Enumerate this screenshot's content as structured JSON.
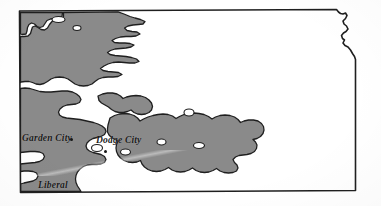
{
  "figure": {
    "kind": "thematic-choropleth-map",
    "region": "Kansas",
    "background_color": "#ffffff",
    "outline_color": "#1f1f1f",
    "shaded_fill_color": "#8a8a8a",
    "unshaded_fill_color": "#ffffff"
  },
  "labels": {
    "garden_city": "Garden City",
    "dodge_city": "Dodge City",
    "liberal": "Liberal"
  },
  "markers": {
    "garden_city_dot": "city-point-marker",
    "dodge_city_dot": "city-point-marker"
  },
  "icons": {
    "state-outline": "state-boundary-outline",
    "shaded-area": "shaded-region-fill",
    "city-point-marker": "filled-circle-dot"
  },
  "geometry": {
    "state_outline_path": "M 19.5 11.0 L 336.5 9.5 L 338.5 12.0 L 340.5 13.5 L 343.0 14.0 L 345.5 13.0 L 347.0 15.5 L 345.5 18.5 L 343.0 21.0 L 344.0 24.0 L 346.5 26.0 L 348.0 29.0 L 346.0 31.5 L 343.5 33.0 L 341.5 35.5 L 342.5 38.5 L 344.5 40.0 L 343.0 43.0 L 345.0 45.5 L 348.0 47.0 L 350.5 50.0 L 352.5 53.5 L 354.5 56.5 L 355.5 59.5 L 355.5 190.5 L 20.5 192.5 Z",
    "shaded_region_paths": [
      "M 20.5 12.5 L 62.5 12.5 L 62.0 16.5 L 58.0 17.0 L 54.5 18.5 L 50.5 19.0 L 47.0 20.5 L 45.0 23.5 L 43.0 26.5 L 40.0 27.5 L 37.0 26.5 L 34.5 24.0 L 31.5 23.0 L 29.0 24.5 L 27.5 27.5 L 27.0 31.0 L 26.0 34.0 L 22.0 34.5 L 20.5 34.0 Z",
      "M 63.5 12.5 L 118.0 11.8 L 124.0 14.0 L 130.0 16.5 L 135.0 18.0 L 140.5 19.5 L 145.0 21.5 L 143.0 24.0 L 138.5 24.5 L 133.0 25.0 L 128.0 26.0 L 124.5 28.0 L 127.0 30.5 L 132.0 31.5 L 137.0 32.0 L 140.0 34.0 L 136.0 36.0 L 131.0 36.5 L 126.0 36.5 L 120.5 37.0 L 115.5 38.5 L 112.0 40.5 L 114.5 42.5 L 119.5 43.0 L 125.0 43.0 L 130.0 43.5 L 134.0 45.0 L 131.0 47.0 L 126.0 48.0 L 120.5 48.5 L 115.0 49.0 L 110.5 50.5 L 107.5 52.5 L 110.0 54.5 L 115.0 55.5 L 120.5 56.0 L 126.0 56.5 L 131.5 57.5 L 136.5 59.0 L 139.0 61.5 L 135.0 63.0 L 129.5 63.0 L 124.0 62.5 L 118.5 62.0 L 113.0 62.5 L 108.0 64.0 L 104.0 66.0 L 100.5 68.5 L 103.0 70.5 L 108.0 71.5 L 113.5 72.0 L 118.5 72.5 L 122.0 74.5 L 118.0 76.5 L 113.0 77.0 L 108.0 77.0 L 103.0 77.5 L 98.5 79.0 L 95.0 81.5 L 92.0 84.0 L 88.0 85.5 L 83.5 86.0 L 79.0 85.5 L 75.0 84.0 L 71.5 81.5 L 68.0 79.0 L 64.0 77.5 L 59.5 77.0 L 55.0 77.5 L 51.0 79.0 L 47.5 81.5 L 44.0 83.5 L 40.0 84.5 L 36.0 84.0 L 32.5 82.5 L 29.0 81.5 L 25.0 81.5 L 21.0 82.0 L 20.5 82.5 L 20.5 36.5 L 24.0 36.5 L 28.0 36.0 L 30.5 33.5 L 31.5 30.0 L 32.5 27.0 L 35.0 26.0 L 38.0 27.5 L 41.0 29.5 L 44.5 30.0 L 47.5 28.0 L 49.5 24.5 L 52.0 21.5 L 56.0 20.0 L 60.5 19.0 L 63.5 17.0 Z",
      "M 20.5 88.5 L 25.0 88.0 L 30.0 88.5 L 35.0 90.0 L 40.0 91.5 L 45.5 92.0 L 51.0 92.0 L 56.5 91.5 L 62.0 91.0 L 67.5 91.0 L 72.5 92.0 L 76.5 94.0 L 79.5 96.5 L 81.0 99.5 L 79.5 102.5 L 76.0 104.0 L 71.5 104.5 L 67.0 105.0 L 63.0 106.5 L 60.0 109.0 L 58.5 112.0 L 59.5 115.0 L 62.5 117.0 L 66.5 118.0 L 71.0 118.5 L 75.5 119.0 L 80.0 119.5 L 84.5 120.5 L 89.0 121.5 L 93.5 122.5 L 98.0 124.0 L 102.0 126.0 L 105.0 128.5 L 106.0 131.5 L 104.5 134.5 L 101.0 136.5 L 97.0 137.5 L 93.0 138.5 L 89.5 140.5 L 87.0 143.0 L 86.0 146.0 L 87.0 149.0 L 89.5 151.0 L 93.0 152.5 L 97.0 153.5 L 101.0 154.5 L 104.5 156.5 L 106.0 159.5 L 104.5 162.5 L 101.0 164.0 L 96.5 164.5 L 92.0 164.5 L 87.5 165.0 L 83.5 166.5 L 80.0 169.0 L 77.5 172.0 L 76.0 175.5 L 75.5 179.0 L 76.0 182.5 L 77.5 186.0 L 79.5 189.0 L 81.0 191.5 L 20.5 191.5 L 20.5 184.0 L 24.0 183.0 L 28.5 182.0 L 33.0 181.0 L 36.5 179.0 L 38.0 176.0 L 36.5 173.0 L 33.0 171.5 L 28.5 171.0 L 24.0 171.0 L 20.5 171.5 L 20.5 164.0 L 25.0 163.5 L 30.0 163.0 L 35.0 162.5 L 39.5 161.5 L 43.0 159.5 L 44.5 156.5 L 43.0 153.5 L 39.5 152.0 L 35.0 151.5 L 30.0 151.5 L 25.0 152.0 L 20.5 152.5 Z",
      "M 110.0 118.0 L 114.5 115.5 L 119.5 114.0 L 124.5 113.5 L 129.5 114.0 L 134.0 115.5 L 137.5 118.0 L 140.0 121.0 L 143.5 119.0 L 148.0 117.0 L 153.0 115.5 L 158.0 114.5 L 163.0 114.0 L 168.0 114.5 L 172.5 116.0 L 176.0 118.5 L 179.5 116.5 L 184.0 114.5 L 189.0 113.5 L 194.0 113.0 L 199.0 113.5 L 204.0 114.5 L 208.5 116.5 L 212.0 119.0 L 215.5 117.0 L 220.0 115.5 L 225.0 115.0 L 230.0 115.5 L 234.5 117.0 L 238.0 119.5 L 240.5 122.5 L 244.0 121.0 L 248.5 120.0 L 253.5 120.0 L 258.0 121.0 L 261.5 123.5 L 263.5 126.5 L 264.0 130.0 L 263.0 133.5 L 260.5 136.5 L 257.0 138.5 L 253.0 139.5 L 255.5 142.0 L 257.0 145.0 L 256.5 148.5 L 254.5 151.5 L 251.0 153.5 L 247.0 154.5 L 243.0 155.0 L 239.0 155.5 L 235.5 157.0 L 233.0 159.5 L 234.5 162.5 L 237.0 165.0 L 238.0 168.0 L 236.5 171.0 L 233.0 172.5 L 228.5 173.0 L 224.0 172.5 L 220.0 171.0 L 216.5 168.5 L 213.0 170.5 L 209.0 172.0 L 204.5 172.5 L 200.0 172.0 L 196.0 170.5 L 192.5 168.0 L 189.0 170.0 L 185.0 171.5 L 180.5 172.0 L 176.0 171.5 L 172.0 170.0 L 168.5 167.5 L 165.0 169.5 L 161.0 171.0 L 156.5 171.5 L 152.0 171.0 L 148.0 169.5 L 144.5 167.0 L 142.0 164.0 L 140.5 160.5 L 137.0 162.0 L 132.5 162.5 L 128.0 162.0 L 124.0 160.5 L 120.5 158.0 L 118.0 155.0 L 116.5 151.5 L 116.0 148.0 L 116.5 144.5 L 118.0 141.0 L 115.0 139.5 L 111.5 137.5 L 109.0 135.0 L 107.5 132.0 L 107.5 128.5 L 108.0 125.0 L 109.0 121.5 Z",
      "M 98.0 96.0 L 102.5 94.0 L 107.5 93.0 L 112.5 93.0 L 117.0 94.0 L 120.5 96.0 L 123.0 98.5 L 126.5 97.0 L 131.0 96.0 L 136.0 95.5 L 141.0 96.0 L 145.5 97.5 L 149.0 100.0 L 151.5 103.0 L 152.5 106.5 L 151.5 110.0 L 149.0 112.5 L 145.5 114.0 L 141.5 114.5 L 137.5 114.0 L 134.0 112.5 L 131.0 110.0 L 127.5 111.5 L 123.5 112.5 L 119.0 112.5 L 115.0 111.5 L 111.5 109.5 L 108.5 107.0 L 105.0 105.0 L 101.5 103.0 L 99.0 100.5 Z"
    ],
    "shaded_holes": [
      "M 52.0 19.5 a 6.5 3.0 0 1 0 13.0 0 a 6.5 3.0 0 1 0 -13.0 0 Z",
      "M 73.0 28.0 a 4.0 2.5 0 1 0 8.0 0 a 4.0 2.5 0 1 0 -8.0 0 Z",
      "M 184.0 112.5 a 5.0 3.5 0 1 0 10.0 0 a 5.0 3.5 0 1 0 -10.0 0 Z",
      "M 193.5 145.5 a 5.5 3.0 0 1 0 11.0 0 a 5.5 3.0 0 1 0 -11.0 0 Z",
      "M 91.5 148.0 a 5.5 3.5 0 1 0 11.0 0 a 5.5 3.5 0 1 0 -11.0 0 Z",
      "M 120.5 152.0 a 5.0 3.0 0 1 0 10.0 0 a 5.0 3.0 0 1 0 -10.0 0 Z",
      "M 157.0 142.0 a 4.5 3.0 0 1 0 9.0 0 a 4.5 3.0 0 1 0 -9.0 0 Z"
    ]
  }
}
